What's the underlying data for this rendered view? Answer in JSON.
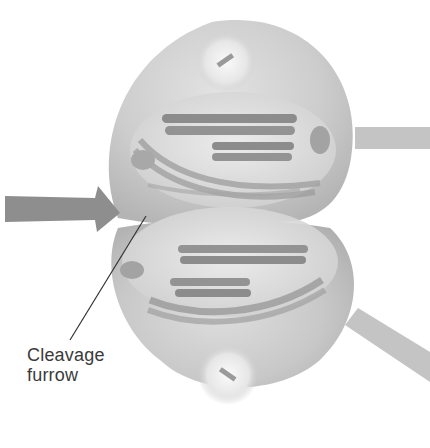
{
  "diagram": {
    "type": "cell-division-cytokinesis",
    "labels": [
      {
        "id": "cleavage-furrow",
        "lines": [
          "Cleavage",
          "furrow"
        ]
      }
    ],
    "elements": [
      "upper-daughter-cell",
      "lower-daughter-cell",
      "centrosome-top",
      "centrosome-bottom",
      "chromosomes",
      "spindle-fibers",
      "cleavage-furrow-pointer-arrow",
      "connector-band-right-upper",
      "connector-band-right-lower"
    ],
    "colors": {
      "background": "#ffffff",
      "cell_fill": "#c9c9c9",
      "cell_shadow": "#a9a9a9",
      "chromosome": "#8c8c8c",
      "arrow": "#8e8e8e",
      "band": "#c4c4c4",
      "text": "#3a3a3a"
    }
  }
}
